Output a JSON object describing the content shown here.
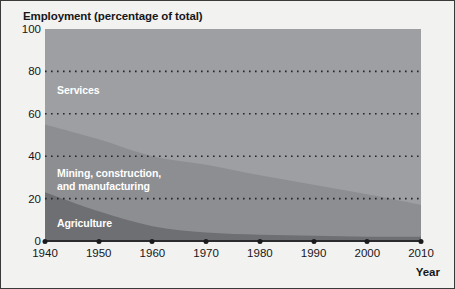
{
  "figure": {
    "background_color": "#f2f2f0",
    "border_color": "#3a3a3a"
  },
  "chart_data": {
    "type": "area",
    "stacked": true,
    "title": "Employment (percentage of total)",
    "xlabel": "Year",
    "ylabel": "",
    "x": [
      1940,
      1950,
      1960,
      1970,
      1980,
      1990,
      2000,
      2010
    ],
    "xlim": [
      1940,
      2010
    ],
    "ylim": [
      0,
      100
    ],
    "ytick_labels": [
      "0",
      "20",
      "40",
      "60",
      "80",
      "100"
    ],
    "yticks": [
      0,
      20,
      40,
      60,
      80,
      100
    ],
    "xtick_labels": [
      "1940",
      "1950",
      "1960",
      "1970",
      "1980",
      "1990",
      "2000",
      "2010"
    ],
    "grid": "horizontal-dotted",
    "legend": "inline-labels",
    "series": [
      {
        "name": "Agriculture",
        "color": "#6d6f72",
        "values": [
          23,
          14,
          7,
          4,
          3,
          2.5,
          2,
          2
        ]
      },
      {
        "name": "Mining, construction,\nand manufacturing",
        "color": "#8c8e91",
        "values": [
          32,
          34,
          33,
          32,
          28,
          24,
          20,
          15
        ]
      },
      {
        "name": "Services",
        "color": "#9d9fa2",
        "values": [
          45,
          52,
          60,
          64,
          69,
          73.5,
          78,
          83
        ]
      }
    ],
    "cumulative_upper_bounds": {
      "agriculture": [
        23,
        14,
        7,
        4,
        3,
        2.5,
        2,
        2
      ],
      "agriculture_plus_industry": [
        55,
        48,
        40,
        36,
        31,
        26.5,
        22,
        17
      ],
      "total": [
        100,
        100,
        100,
        100,
        100,
        100,
        100,
        100
      ]
    }
  },
  "labels": {
    "services": "Services",
    "industry": "Mining, construction,\nand manufacturing",
    "agriculture": "Agriculture",
    "year_axis": "Year"
  }
}
